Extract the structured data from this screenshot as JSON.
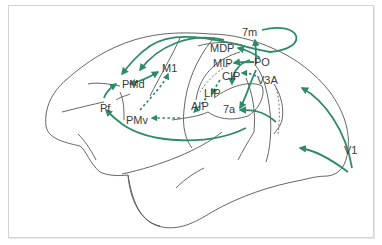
{
  "diagram": {
    "type": "brain-connectivity-diagram",
    "colors": {
      "arrow": "#2e8a68",
      "outline": "#555555",
      "label": "#3a3a3a",
      "frame": "#d4d4d4"
    },
    "areas": [
      {
        "id": "7m",
        "label": "7m"
      },
      {
        "id": "MDP",
        "label": "MDP"
      },
      {
        "id": "PO",
        "label": "PO"
      },
      {
        "id": "MIP",
        "label": "MIP"
      },
      {
        "id": "CIP",
        "label": "CIP"
      },
      {
        "id": "V3A",
        "label": "V3A"
      },
      {
        "id": "LIP",
        "label": "LIP"
      },
      {
        "id": "AIP",
        "label": "AIP"
      },
      {
        "id": "7a",
        "label": "7a"
      },
      {
        "id": "M1",
        "label": "M1"
      },
      {
        "id": "PMd",
        "label": "PMd"
      },
      {
        "id": "PMv",
        "label": "PMv"
      },
      {
        "id": "Pf",
        "label": "Pf"
      },
      {
        "id": "V1",
        "label": "V1"
      }
    ],
    "connections": [
      {
        "from": "V1",
        "to": "PO",
        "style": "solid"
      },
      {
        "from": "V1",
        "to": "V3A",
        "style": "solid"
      },
      {
        "from": "V3A",
        "to": "7a",
        "style": "solid"
      },
      {
        "from": "V3A",
        "to": "CIP",
        "style": "dashed"
      },
      {
        "from": "PO",
        "to": "7m",
        "style": "solid"
      },
      {
        "from": "PO",
        "to": "MDP",
        "style": "solid"
      },
      {
        "from": "PO",
        "to": "MIP",
        "style": "solid"
      },
      {
        "from": "PO",
        "to": "7a",
        "style": "solid"
      },
      {
        "from": "CIP",
        "to": "LIP",
        "style": "dashed"
      },
      {
        "from": "LIP",
        "to": "AIP",
        "style": "dashed"
      },
      {
        "from": "AIP",
        "to": "PMv",
        "style": "dashed"
      },
      {
        "from": "PMv",
        "to": "M1",
        "style": "dashed"
      },
      {
        "from": "PMd",
        "to": "M1",
        "style": "solid"
      },
      {
        "from": "7m",
        "to": "PMd",
        "style": "solid"
      },
      {
        "from": "MDP",
        "to": "PMd",
        "style": "solid"
      },
      {
        "from": "7a",
        "to": "Pf",
        "style": "solid"
      },
      {
        "from": "Pf",
        "to": "PMd",
        "style": "solid"
      }
    ]
  }
}
